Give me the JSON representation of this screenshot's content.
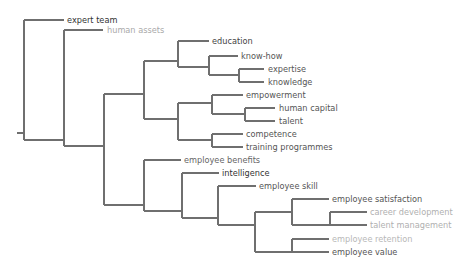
{
  "diagram": {
    "type": "dendrogram",
    "orientation": "left-to-right",
    "line_color": "#6f6f6f",
    "leaves": [
      {
        "label": "expert team",
        "x": 67,
        "y": 20,
        "color": "#333333"
      },
      {
        "label": "human assets",
        "x": 107,
        "y": 30,
        "color": "#aaaaaa"
      },
      {
        "label": "education",
        "x": 212,
        "y": 41,
        "color": "#444444"
      },
      {
        "label": "know-how",
        "x": 241,
        "y": 56,
        "color": "#555555"
      },
      {
        "label": "expertise",
        "x": 268,
        "y": 69,
        "color": "#555555"
      },
      {
        "label": "knowledge",
        "x": 268,
        "y": 82,
        "color": "#555555"
      },
      {
        "label": "empowerment",
        "x": 246,
        "y": 95,
        "color": "#555555"
      },
      {
        "label": "human capital",
        "x": 279,
        "y": 108,
        "color": "#555555"
      },
      {
        "label": "talent",
        "x": 279,
        "y": 121,
        "color": "#555555"
      },
      {
        "label": "competence",
        "x": 246,
        "y": 134,
        "color": "#555555"
      },
      {
        "label": "training programmes",
        "x": 246,
        "y": 147,
        "color": "#555555"
      },
      {
        "label": "employee benefits",
        "x": 184,
        "y": 160,
        "color": "#666666"
      },
      {
        "label": "intelligence",
        "x": 222,
        "y": 173,
        "color": "#333333"
      },
      {
        "label": "employee skill",
        "x": 259,
        "y": 186,
        "color": "#555555"
      },
      {
        "label": "employee satisfaction",
        "x": 332,
        "y": 199,
        "color": "#555555"
      },
      {
        "label": "career development",
        "x": 370,
        "y": 212,
        "color": "#b0b0b0"
      },
      {
        "label": "talent management",
        "x": 370,
        "y": 225,
        "color": "#b0b0b0"
      },
      {
        "label": "employee retention",
        "x": 332,
        "y": 239,
        "color": "#b8b8b8"
      },
      {
        "label": "employee value",
        "x": 332,
        "y": 252,
        "color": "#555555"
      }
    ],
    "segments": [
      [
        17,
        133,
        24,
        133
      ],
      [
        24,
        20,
        24,
        140
      ],
      [
        24,
        20,
        64,
        20
      ],
      [
        24,
        140,
        64,
        140
      ],
      [
        64,
        30,
        64,
        146
      ],
      [
        64,
        30,
        103,
        30
      ],
      [
        64,
        146,
        104,
        146
      ],
      [
        104,
        94,
        104,
        205
      ],
      [
        104,
        94,
        144,
        94
      ],
      [
        104,
        205,
        144,
        205
      ],
      [
        144,
        61,
        144,
        119
      ],
      [
        144,
        61,
        178,
        61
      ],
      [
        144,
        119,
        178,
        119
      ],
      [
        178,
        41,
        178,
        67
      ],
      [
        178,
        41,
        209,
        41
      ],
      [
        178,
        67,
        209,
        67
      ],
      [
        209,
        56,
        209,
        75
      ],
      [
        209,
        56,
        238,
        56
      ],
      [
        209,
        75,
        239,
        75
      ],
      [
        239,
        69,
        239,
        82
      ],
      [
        239,
        69,
        264,
        69
      ],
      [
        239,
        82,
        264,
        82
      ],
      [
        178,
        103,
        178,
        140
      ],
      [
        178,
        103,
        212,
        103
      ],
      [
        178,
        140,
        212,
        140
      ],
      [
        212,
        95,
        212,
        114
      ],
      [
        212,
        95,
        243,
        95
      ],
      [
        212,
        114,
        245,
        114
      ],
      [
        245,
        108,
        245,
        121
      ],
      [
        245,
        108,
        275,
        108
      ],
      [
        245,
        121,
        275,
        121
      ],
      [
        212,
        134,
        212,
        147
      ],
      [
        212,
        134,
        243,
        134
      ],
      [
        212,
        147,
        243,
        147
      ],
      [
        144,
        160,
        144,
        211
      ],
      [
        144,
        160,
        181,
        160
      ],
      [
        144,
        211,
        182,
        211
      ],
      [
        182,
        173,
        182,
        218
      ],
      [
        182,
        173,
        219,
        173
      ],
      [
        182,
        218,
        218,
        218
      ],
      [
        218,
        186,
        218,
        225
      ],
      [
        218,
        186,
        256,
        186
      ],
      [
        218,
        225,
        255,
        225
      ],
      [
        255,
        212,
        255,
        252
      ],
      [
        255,
        212,
        292,
        212
      ],
      [
        255,
        252,
        292,
        252
      ],
      [
        292,
        199,
        292,
        225
      ],
      [
        292,
        199,
        329,
        199
      ],
      [
        292,
        225,
        330,
        225
      ],
      [
        330,
        212,
        330,
        225
      ],
      [
        330,
        212,
        367,
        212
      ],
      [
        330,
        225,
        367,
        225
      ],
      [
        292,
        239,
        292,
        252
      ],
      [
        292,
        239,
        329,
        239
      ],
      [
        292,
        252,
        329,
        252
      ]
    ]
  }
}
